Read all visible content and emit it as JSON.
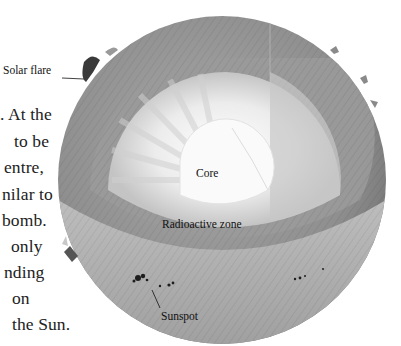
{
  "diagram": {
    "labels": {
      "solar_flare": "Solar flare",
      "core": "Core",
      "radioactive_zone": "Radioactive zone",
      "sunspot": "Sunspot"
    },
    "colors": {
      "background": "#ffffff",
      "surface": "#8a8a8a",
      "convective_layer": "#9c9c9c",
      "radiative_zone": "#d8d8d8",
      "core": "#f6f6f6",
      "text": "#1a1a1a"
    }
  },
  "body_text": {
    "lines": [
      ". At the",
      "to be",
      "entre,",
      "nilar to",
      "bomb.",
      "only",
      "nding",
      "on",
      "the Sun."
    ]
  }
}
